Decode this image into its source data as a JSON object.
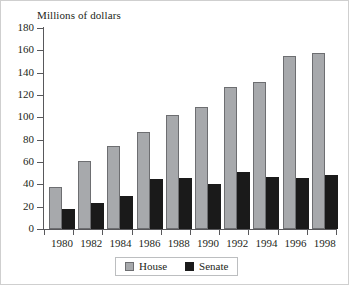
{
  "chart_data": {
    "type": "bar",
    "title": "Millions of dollars",
    "xlabel": "",
    "ylabel": "Millions of dollars",
    "ylim": [
      0,
      180
    ],
    "ytick_step": 20,
    "yticks": [
      180,
      160,
      140,
      120,
      100,
      80,
      60,
      40,
      20,
      0
    ],
    "grid": false,
    "legend_position": "bottom",
    "categories": [
      "1980",
      "1982",
      "1984",
      "1986",
      "1988",
      "1990",
      "1992",
      "1994",
      "1996",
      "1998"
    ],
    "series": [
      {
        "name": "House",
        "color": "#a7a9ac",
        "values": [
          38,
          61,
          74,
          87,
          102,
          109,
          127,
          132,
          155,
          158
        ]
      },
      {
        "name": "Senate",
        "color": "#1a1a1a",
        "values": [
          18,
          23,
          30,
          45,
          46,
          40,
          51,
          47,
          46,
          48
        ]
      }
    ]
  }
}
